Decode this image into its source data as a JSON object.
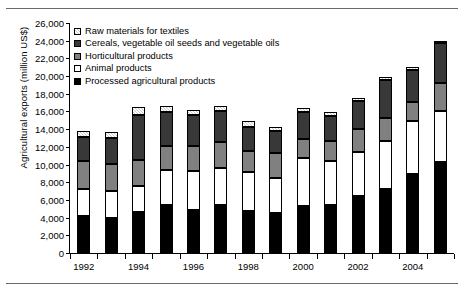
{
  "chart_data": {
    "type": "bar",
    "stacked": true,
    "title": "",
    "xlabel": "",
    "ylabel": "Agricultural exports (million US$)",
    "ylim": [
      0,
      26000
    ],
    "ytick_step": 2000,
    "yticks": [
      "0",
      "2,000",
      "4,000",
      "6,000",
      "8,000",
      "10,000",
      "12,000",
      "14,000",
      "16,000",
      "18,000",
      "20,000",
      "22,000",
      "24,000",
      "26,000"
    ],
    "grid": false,
    "legend_position": "top-left",
    "categories": [
      1992,
      1993,
      1994,
      1995,
      1996,
      1997,
      1998,
      1999,
      2000,
      2001,
      2002,
      2003,
      2004,
      2005
    ],
    "xtick_labels": [
      "1992",
      "1994",
      "1996",
      "1998",
      "2000",
      "2002",
      "2004"
    ],
    "series": [
      {
        "name": "Processed agricultural products",
        "swatch": "solid-black",
        "color": "#000000",
        "values": [
          4200,
          4000,
          4600,
          5400,
          4900,
          5400,
          4800,
          4500,
          5300,
          5400,
          6400,
          7200,
          8900,
          10300
        ]
      },
      {
        "name": "Animal products",
        "swatch": "solid-white",
        "color": "#ffffff",
        "values": [
          3000,
          3000,
          3000,
          4000,
          4400,
          4200,
          4400,
          4000,
          5400,
          5000,
          5000,
          5500,
          6000,
          5700
        ]
      },
      {
        "name": "Horticultural products",
        "swatch": "mid-gray",
        "color": "#808080",
        "values": [
          3200,
          3100,
          2900,
          2700,
          2800,
          3000,
          2300,
          2800,
          2200,
          2300,
          2600,
          2600,
          2200,
          3200
        ]
      },
      {
        "name": "Cereals, vegetable oil seeds and vegetable oils",
        "swatch": "dark-gray",
        "color": "#383838",
        "values": [
          2700,
          2900,
          5100,
          3800,
          3500,
          3400,
          2800,
          2500,
          3000,
          2800,
          3200,
          4300,
          3600,
          4500
        ]
      },
      {
        "name": "Raw materials for textiles",
        "swatch": "light-hatched",
        "color": "#c9c9c9",
        "values": [
          700,
          700,
          900,
          700,
          600,
          600,
          600,
          500,
          500,
          400,
          300,
          300,
          300,
          300
        ]
      }
    ],
    "legend_entries": [
      "Raw materials for textiles",
      "Cereals, vegetable oil seeds and vegetable oils",
      "Horticultural products",
      "Animal products",
      "Processed agricultural products"
    ]
  }
}
